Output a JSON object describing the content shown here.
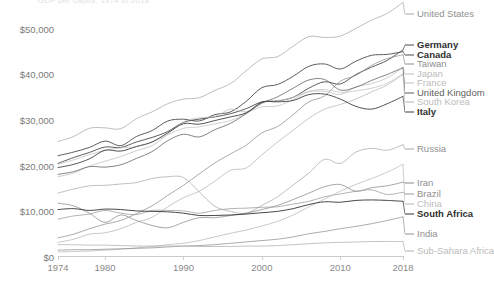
{
  "meta": {
    "cut_title": "GDP per capita, 1974 to 2018"
  },
  "axes": {
    "y_ticks": [
      {
        "label": "$50,000",
        "value": 50000
      },
      {
        "label": "$40,000",
        "value": 40000
      },
      {
        "label": "$30,000",
        "value": 30000
      },
      {
        "label": "$20,000",
        "value": 20000
      },
      {
        "label": "$10,000",
        "value": 10000
      },
      {
        "label": "$0",
        "value": 0
      }
    ],
    "x_ticks": [
      {
        "label": "1974",
        "value": 1974
      },
      {
        "label": "1980",
        "value": 1980
      },
      {
        "label": "1990",
        "value": 1990
      },
      {
        "label": "2000",
        "value": 2000
      },
      {
        "label": "2010",
        "value": 2010
      },
      {
        "label": "2018",
        "value": 2018
      }
    ]
  },
  "chart_data": {
    "type": "line",
    "title": "GDP per capita, 1974 to 2018",
    "xlabel": "",
    "ylabel": "",
    "xlim": [
      1974,
      2018
    ],
    "ylim": [
      0,
      55000
    ],
    "grid": false,
    "legend_position": "right-inline-labels",
    "x": [
      1974,
      1976,
      1978,
      1980,
      1982,
      1984,
      1986,
      1988,
      1990,
      1992,
      1994,
      1996,
      1998,
      2000,
      2002,
      2004,
      2006,
      2008,
      2010,
      2012,
      2014,
      2016,
      2018
    ],
    "series": [
      {
        "name": "United States",
        "color": "#a8a8a8",
        "emphasis": "light",
        "label_y": 14,
        "values": [
          25300,
          26400,
          28200,
          28300,
          28100,
          30300,
          31800,
          33600,
          34600,
          34900,
          36500,
          38000,
          40800,
          43400,
          43900,
          46200,
          48300,
          48100,
          48400,
          50100,
          51900,
          53400,
          55800
        ]
      },
      {
        "name": "Germany",
        "color": "#4a4a4a",
        "emphasis": "bold",
        "label_y": 45,
        "values": [
          20500,
          21800,
          22900,
          24100,
          24000,
          25200,
          26200,
          27500,
          29500,
          30200,
          30700,
          31400,
          32500,
          34000,
          34200,
          35000,
          37000,
          38400,
          37900,
          40000,
          41600,
          43100,
          45400
        ]
      },
      {
        "name": "Canada",
        "color": "#4a4a4a",
        "emphasis": "bold",
        "label_y": 55,
        "values": [
          22200,
          23000,
          24000,
          25400,
          24400,
          26400,
          27700,
          29800,
          30200,
          29800,
          31200,
          31800,
          34100,
          37100,
          37800,
          39600,
          41800,
          42300,
          41200,
          42900,
          44200,
          44400,
          45000
        ]
      },
      {
        "name": "Taiwan",
        "color": "#8e8e8e",
        "emphasis": "light",
        "label_y": 64,
        "values": [
          4200,
          5000,
          6200,
          7200,
          8000,
          9500,
          11200,
          13500,
          15700,
          18200,
          20600,
          22600,
          24500,
          27200,
          28600,
          31200,
          34000,
          35300,
          38500,
          39800,
          42000,
          43500,
          44300
        ]
      },
      {
        "name": "Japan",
        "color": "#bdbdbd",
        "emphasis": "faint",
        "label_y": 74,
        "values": [
          17600,
          18400,
          19900,
          21000,
          22000,
          23300,
          24400,
          26900,
          29600,
          30500,
          30800,
          32400,
          31800,
          32900,
          33100,
          34500,
          36200,
          36300,
          35600,
          37300,
          38000,
          39300,
          41500
        ]
      },
      {
        "name": "France",
        "color": "#c2c2c2",
        "emphasis": "faint",
        "label_y": 83,
        "values": [
          20300,
          21300,
          22400,
          23400,
          23900,
          24200,
          25200,
          26800,
          28200,
          28500,
          29200,
          29900,
          31500,
          33800,
          34200,
          35000,
          36300,
          36700,
          36100,
          36400,
          37000,
          38100,
          40200
        ]
      },
      {
        "name": "United Kingdom",
        "color": "#5c5c5c",
        "emphasis": "mid",
        "label_y": 93,
        "values": [
          18100,
          18700,
          19800,
          19700,
          20200,
          21600,
          23100,
          25500,
          26900,
          26300,
          27900,
          29300,
          31400,
          33700,
          35100,
          37000,
          38800,
          38900,
          36600,
          37200,
          38700,
          40000,
          41500
        ]
      },
      {
        "name": "South Korea",
        "color": "#b5b5b5",
        "emphasis": "faint",
        "label_y": 102,
        "values": [
          3200,
          3900,
          5000,
          5300,
          6200,
          7600,
          8700,
          11000,
          13000,
          14400,
          16600,
          19000,
          19500,
          22400,
          25200,
          27800,
          30400,
          32400,
          33400,
          34600,
          36200,
          37700,
          40000
        ]
      },
      {
        "name": "Italy",
        "color": "#3f3f3f",
        "emphasis": "bold",
        "label_y": 112,
        "values": [
          19600,
          20300,
          21500,
          23400,
          23200,
          24200,
          25200,
          27200,
          29200,
          29100,
          29900,
          30700,
          31600,
          33900,
          34000,
          34300,
          35600,
          35700,
          34600,
          33000,
          32400,
          33600,
          35200
        ]
      },
      {
        "name": "Russia",
        "color": "#a9a9a9",
        "emphasis": "light",
        "label_y": 149,
        "values": [
          14000,
          14900,
          15600,
          15700,
          16000,
          16300,
          17200,
          17600,
          17400,
          14300,
          11100,
          10000,
          9600,
          11300,
          13200,
          15800,
          18400,
          21400,
          20500,
          23000,
          23800,
          23400,
          24600
        ]
      },
      {
        "name": "Iran",
        "color": "#8a8a8a",
        "emphasis": "light",
        "label_y": 183,
        "values": [
          11800,
          11200,
          9600,
          7600,
          9200,
          8000,
          6900,
          6400,
          7600,
          8600,
          8600,
          9100,
          9600,
          10400,
          11300,
          12600,
          14000,
          15400,
          15900,
          14400,
          15200,
          15600,
          16400
        ]
      },
      {
        "name": "Brazil",
        "color": "#9a9a9a",
        "emphasis": "light",
        "label_y": 194,
        "values": [
          8300,
          9000,
          9400,
          10200,
          9600,
          9300,
          10200,
          10200,
          10100,
          9600,
          10200,
          10600,
          10700,
          10900,
          11000,
          11600,
          12200,
          13200,
          13800,
          14400,
          14700,
          13700,
          14200
        ]
      },
      {
        "name": "China",
        "color": "#b8b8b8",
        "emphasis": "faint",
        "label_y": 204,
        "values": [
          1100,
          1200,
          1300,
          1500,
          1700,
          2000,
          2300,
          2700,
          3000,
          3600,
          4400,
          5200,
          5900,
          6800,
          7800,
          9200,
          11000,
          12700,
          14400,
          15900,
          17200,
          18600,
          20300
        ]
      },
      {
        "name": "South Africa",
        "color": "#333333",
        "emphasis": "bold",
        "label_y": 214,
        "values": [
          10400,
          10600,
          10200,
          10500,
          10400,
          10100,
          10000,
          9900,
          9600,
          9100,
          9100,
          9200,
          9400,
          9700,
          10000,
          10600,
          11500,
          12100,
          12000,
          12400,
          12500,
          12400,
          12200
        ]
      },
      {
        "name": "India",
        "color": "#909090",
        "emphasis": "light",
        "label_y": 234,
        "values": [
          1500,
          1600,
          1600,
          1700,
          1800,
          1900,
          2000,
          2200,
          2400,
          2500,
          2700,
          3000,
          3300,
          3600,
          3900,
          4400,
          5100,
          5600,
          6200,
          6700,
          7300,
          8000,
          8800
        ]
      },
      {
        "name": "Sub-Sahara Africa",
        "color": "#b0b0b0",
        "emphasis": "faint",
        "label_y": 251,
        "values": [
          2700,
          2700,
          2600,
          2600,
          2500,
          2400,
          2400,
          2400,
          2400,
          2300,
          2300,
          2300,
          2400,
          2400,
          2500,
          2700,
          2900,
          3100,
          3200,
          3300,
          3400,
          3400,
          3400
        ]
      }
    ]
  }
}
